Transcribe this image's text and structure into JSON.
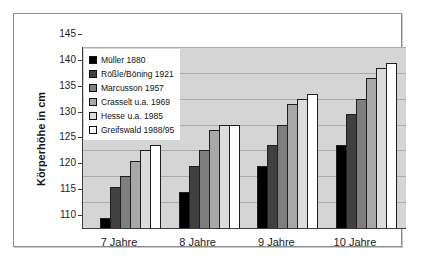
{
  "chart_data": {
    "type": "bar",
    "title": "",
    "xlabel": "",
    "ylabel": "Körperhöhe in cm",
    "ylim": [
      110,
      145
    ],
    "ytick_step": 5,
    "yticks": [
      145,
      140,
      135,
      130,
      125,
      120,
      115,
      110
    ],
    "categories": [
      "7 Jahre",
      "8 Jahre",
      "9 Jahre",
      "10 Jahre"
    ],
    "series": [
      {
        "name": "Müller 1880",
        "color": "#000000",
        "values": [
          112,
          117,
          122,
          126
        ]
      },
      {
        "name": "Rößle/Böning 1921",
        "color": "#404040",
        "values": [
          118,
          122,
          126,
          132
        ]
      },
      {
        "name": "Marcusson 1957",
        "color": "#7e7e7e",
        "values": [
          120,
          125,
          130,
          135
        ]
      },
      {
        "name": "Crasselt u.a. 1969",
        "color": "#a8a8a8",
        "values": [
          123,
          129,
          134,
          139
        ]
      },
      {
        "name": "Hesse u.a. 1985",
        "color": "#dcdcdc",
        "values": [
          125,
          130,
          135,
          141
        ]
      },
      {
        "name": "Greifswald 1988/95",
        "color": "#ffffff",
        "values": [
          126,
          130,
          136,
          142
        ]
      }
    ],
    "grid": true,
    "legend_position": "top-left",
    "colors": {
      "plot_background": "#d5d5d5",
      "gridline": "#ababab",
      "axis": "#3c3c3c",
      "bar_border": "#1f1f1f",
      "figure_border": "#8c8c8c",
      "figure_background": "#ffffff"
    }
  }
}
